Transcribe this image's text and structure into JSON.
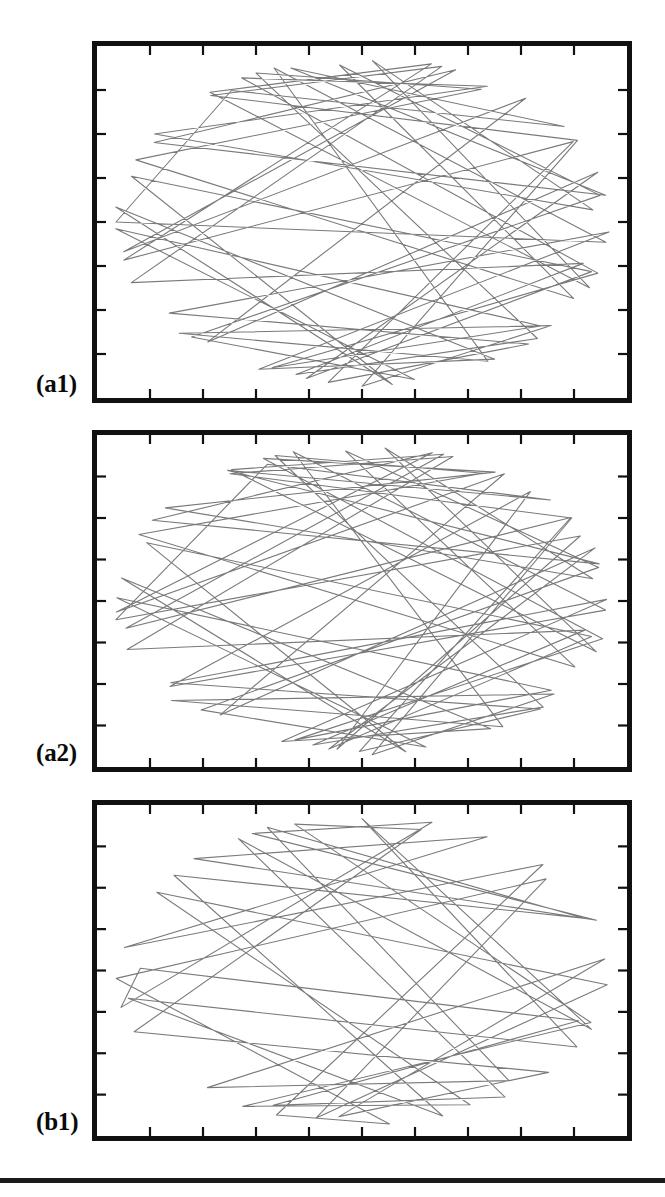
{
  "figure": {
    "background_color": "#ffffff",
    "frame_color": "#111111",
    "trace_color": "#7a7a7a",
    "label_color": "#0a0a0a",
    "rule_color": "#1a1a1a",
    "panel_count": 3
  },
  "panels": [
    {
      "id": "a1",
      "label": "(a1)",
      "x": 92,
      "y": 41,
      "width": 540,
      "height": 362,
      "label_x": 36,
      "label_y": 371
    },
    {
      "id": "a2",
      "label": "(a2)",
      "x": 92,
      "y": 430,
      "width": 540,
      "height": 342,
      "label_x": 36,
      "label_y": 740
    },
    {
      "id": "b1",
      "label": "(b1)",
      "x": 92,
      "y": 800,
      "width": 540,
      "height": 341,
      "label_x": 36,
      "label_y": 1109
    }
  ],
  "footer_rule": {
    "x": 0,
    "y": 1178,
    "width": 665,
    "height": 5
  },
  "chart_data": {
    "type": "line",
    "title": "",
    "xlabel": "",
    "ylabel": "",
    "grid": false,
    "legend": "none",
    "axes": {
      "x_ticks_interior": 9,
      "y_ticks_interior": 7,
      "tick_direction": "inward",
      "tick_length_px": 9,
      "tick_labels": [],
      "xlim": [
        0,
        1
      ],
      "ylim": [
        0,
        1
      ]
    },
    "series": [
      {
        "name": "(a1)",
        "panel": "a1",
        "style": "polyline",
        "color": "#7a7a7a",
        "line_width": 1.1,
        "segment_count": 58,
        "caustic": "elliptical, open core",
        "boundary_fill_fraction": 0.86,
        "x": [
          0.015,
          0.268,
          0.915,
          0.365,
          0.985,
          0.118,
          0.688,
          0.048,
          0.86,
          0.225,
          0.972,
          0.395,
          0.93,
          0.072,
          0.56,
          0.008,
          0.76,
          0.3,
          0.995,
          0.16,
          0.84,
          0.435,
          0.905,
          0.035,
          0.64,
          0.195,
          0.96,
          0.52,
          0.88,
          0.09,
          0.73,
          0.255,
          0.99,
          0.34,
          0.82,
          0.012,
          0.6,
          0.175,
          0.945,
          0.46,
          0.895,
          0.06,
          0.7,
          0.285,
          0.975,
          0.38,
          0.855,
          0.025,
          0.66,
          0.21,
          0.935,
          0.5,
          0.87,
          0.105,
          0.745,
          0.32,
          0.98,
          0.015
        ],
        "y": [
          0.5,
          0.148,
          0.205,
          0.06,
          0.42,
          0.28,
          0.04,
          0.585,
          0.09,
          0.822,
          0.35,
          0.945,
          0.64,
          0.372,
          0.985,
          0.455,
          0.905,
          0.93,
          0.53,
          0.742,
          0.875,
          0.965,
          0.268,
          0.612,
          0.02,
          0.108,
          0.7,
          0.035,
          0.47,
          0.238,
          0.125,
          0.058,
          0.66,
          0.89,
          0.78,
          0.52,
          0.952,
          0.83,
          0.425,
          0.078,
          0.715,
          0.318,
          0.165,
          0.045,
          0.975,
          0.918,
          0.6,
          0.688,
          0.03,
          0.135,
          0.252,
          0.995,
          0.805,
          0.862,
          0.908,
          0.025,
          0.56,
          0.5
        ]
      },
      {
        "name": "(a2)",
        "panel": "a2",
        "style": "polyline",
        "color": "#7a7a7a",
        "line_width": 1.1,
        "segment_count": 62,
        "caustic": "elliptical, narrower core",
        "boundary_fill_fraction": 0.91,
        "x": [
          0.005,
          0.33,
          0.88,
          0.205,
          0.96,
          0.085,
          0.64,
          0.015,
          0.8,
          0.27,
          0.995,
          0.44,
          0.905,
          0.13,
          0.585,
          0.04,
          0.74,
          0.355,
          0.975,
          0.185,
          0.86,
          0.495,
          0.92,
          0.065,
          0.67,
          0.24,
          0.985,
          0.545,
          0.89,
          0.11,
          0.76,
          0.3,
          0.998,
          0.39,
          0.835,
          0.02,
          0.62,
          0.215,
          0.95,
          0.47,
          0.88,
          0.055,
          0.715,
          0.325,
          0.99,
          0.415,
          0.845,
          0.03,
          0.69,
          0.25,
          0.94,
          0.52,
          0.865,
          0.095,
          0.775,
          0.36,
          0.97,
          0.165,
          0.82,
          0.455,
          0.91,
          0.005
        ],
        "y": [
          0.56,
          0.108,
          0.175,
          0.042,
          0.385,
          0.245,
          0.028,
          0.535,
          0.072,
          0.795,
          0.32,
          0.928,
          0.6,
          0.34,
          0.968,
          0.43,
          0.88,
          0.905,
          0.495,
          0.715,
          0.848,
          0.945,
          0.232,
          0.58,
          0.012,
          0.082,
          0.668,
          0.022,
          0.44,
          0.205,
          0.098,
          0.038,
          0.625,
          0.865,
          0.752,
          0.49,
          0.938,
          0.808,
          0.398,
          0.06,
          0.688,
          0.288,
          0.138,
          0.032,
          0.958,
          0.898,
          0.572,
          0.655,
          0.018,
          0.115,
          0.222,
          0.982,
          0.782,
          0.838,
          0.892,
          0.015,
          0.528,
          0.738,
          0.168,
          0.925,
          0.305,
          0.56
        ]
      },
      {
        "name": "(b1)",
        "panel": "b1",
        "style": "polyline",
        "color": "#7a7a7a",
        "line_width": 1.1,
        "segment_count": 40,
        "caustic": "none, chords cross the centre",
        "boundary_fill_fraction": 0.78,
        "x": [
          0.01,
          0.64,
          0.285,
          0.995,
          0.17,
          0.76,
          0.06,
          0.905,
          0.33,
          0.555,
          0.015,
          0.82,
          0.415,
          0.985,
          0.12,
          0.7,
          0.24,
          0.94,
          0.37,
          0.6,
          0.035,
          0.875,
          0.46,
          0.965,
          0.205,
          0.735,
          0.305,
          0.89,
          0.145,
          0.66,
          0.08,
          0.93,
          0.5,
          0.975,
          0.26,
          0.795,
          0.35,
          0.855,
          0.19,
          0.01
        ],
        "y": [
          0.62,
          0.025,
          0.07,
          0.33,
          0.148,
          0.055,
          0.432,
          0.12,
          0.96,
          0.992,
          0.525,
          0.245,
          0.938,
          0.545,
          0.268,
          0.898,
          0.975,
          0.66,
          0.048,
          0.118,
          0.7,
          0.828,
          0.905,
          0.465,
          0.858,
          0.782,
          0.028,
          0.352,
          0.212,
          0.962,
          0.58,
          0.745,
          0.035,
          0.695,
          0.09,
          0.918,
          0.865,
          0.632,
          0.495,
          0.62
        ]
      }
    ]
  }
}
